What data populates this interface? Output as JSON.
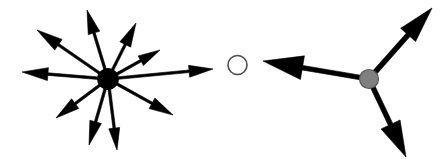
{
  "figure": {
    "background_color": "#ffffff",
    "width": 444,
    "height": 159
  },
  "palette": {
    "edge_color": "#000000",
    "hub_fill": "#000000",
    "isolated_fill": "#ffffff",
    "isolated_stroke": "#4d4d4d",
    "gray_fill": "#808080",
    "gray_stroke": "#555555"
  },
  "nodes": [
    {
      "id": "hub-node",
      "name": "high-degree-node",
      "cx": 108,
      "cy": 79,
      "r": 10.5,
      "fill": "#000000",
      "stroke": "#000000",
      "stroke_width": 1,
      "out_degree": 10
    },
    {
      "id": "isolated-node",
      "name": "isolated-node",
      "cx": 237.5,
      "cy": 65,
      "r": 9.5,
      "fill": "#ffffff",
      "stroke": "#4d4d4d",
      "stroke_width": 1.6,
      "out_degree": 0
    },
    {
      "id": "gray-node",
      "name": "medium-degree-node",
      "cx": 369,
      "cy": 79,
      "r": 9.5,
      "fill": "#808080",
      "stroke": "#555555",
      "stroke_width": 1.2,
      "out_degree": 3
    }
  ],
  "arrows": {
    "hub": [
      {
        "id": "hub-arrow-w",
        "name": "hub-arrow-west",
        "x1": 108,
        "y1": 79,
        "x2": 22,
        "y2": 72,
        "shaft_width": 2.6,
        "head_length": 26,
        "head_width": 13
      },
      {
        "id": "hub-arrow-nw",
        "name": "hub-arrow-northwest",
        "x1": 108,
        "y1": 79,
        "x2": 37,
        "y2": 30,
        "shaft_width": 2.6,
        "head_length": 26,
        "head_width": 13
      },
      {
        "id": "hub-arrow-nnw",
        "name": "hub-arrow-north-northwest",
        "x1": 108,
        "y1": 79,
        "x2": 87,
        "y2": 10,
        "shaft_width": 2.6,
        "head_length": 24,
        "head_width": 12
      },
      {
        "id": "hub-arrow-nne",
        "name": "hub-arrow-north-northeast",
        "x1": 108,
        "y1": 79,
        "x2": 136,
        "y2": 23,
        "shaft_width": 2.6,
        "head_length": 24,
        "head_width": 12
      },
      {
        "id": "hub-arrow-ne",
        "name": "hub-arrow-northeast",
        "x1": 108,
        "y1": 79,
        "x2": 160,
        "y2": 50,
        "shaft_width": 2.6,
        "head_length": 22,
        "head_width": 11
      },
      {
        "id": "hub-arrow-e",
        "name": "hub-arrow-east",
        "x1": 108,
        "y1": 79,
        "x2": 213,
        "y2": 69,
        "shaft_width": 2.6,
        "head_length": 24,
        "head_width": 12
      },
      {
        "id": "hub-arrow-se",
        "name": "hub-arrow-southeast",
        "x1": 108,
        "y1": 79,
        "x2": 173,
        "y2": 115,
        "shaft_width": 2.6,
        "head_length": 24,
        "head_width": 12
      },
      {
        "id": "hub-arrow-sse",
        "name": "hub-arrow-south-southeast",
        "x1": 108,
        "y1": 79,
        "x2": 117,
        "y2": 150,
        "shaft_width": 2.6,
        "head_length": 22,
        "head_width": 11
      },
      {
        "id": "hub-arrow-ssw",
        "name": "hub-arrow-south-southwest",
        "x1": 108,
        "y1": 79,
        "x2": 89,
        "y2": 145,
        "shaft_width": 2.6,
        "head_length": 24,
        "head_width": 12
      },
      {
        "id": "hub-arrow-sw",
        "name": "hub-arrow-southwest",
        "x1": 108,
        "y1": 79,
        "x2": 56,
        "y2": 118,
        "shaft_width": 2.6,
        "head_length": 24,
        "head_width": 12
      }
    ],
    "gray": [
      {
        "id": "gray-arrow-ne",
        "name": "gray-arrow-northeast",
        "x1": 369,
        "y1": 79,
        "x2": 432,
        "y2": 8,
        "shaft_width": 5.0,
        "head_length": 36,
        "head_width": 20
      },
      {
        "id": "gray-arrow-w",
        "name": "gray-arrow-west",
        "x1": 369,
        "y1": 79,
        "x2": 263,
        "y2": 61,
        "shaft_width": 4.6,
        "head_length": 40,
        "head_width": 24
      },
      {
        "id": "gray-arrow-se",
        "name": "gray-arrow-southeast",
        "x1": 369,
        "y1": 79,
        "x2": 406,
        "y2": 157,
        "shaft_width": 4.8,
        "head_length": 36,
        "head_width": 21
      }
    ]
  }
}
